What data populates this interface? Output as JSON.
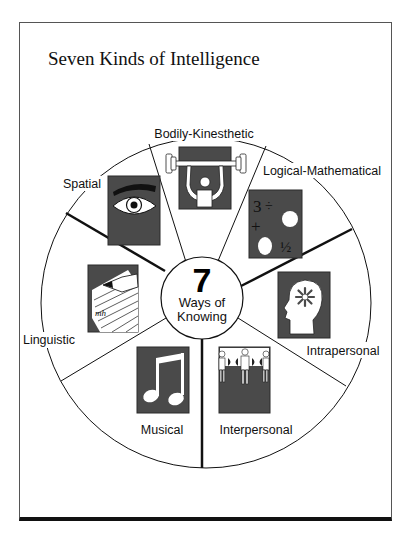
{
  "title": "Seven Kinds of Intelligence",
  "center": {
    "number": "7",
    "line1": "Ways of",
    "line2": "Knowing"
  },
  "segments": [
    {
      "label": "Bodily-Kinesthetic",
      "icon": "weightlifter-icon"
    },
    {
      "label": "Logical-Mathematical",
      "icon": "math-symbols-icon"
    },
    {
      "label": "Intrapersonal",
      "icon": "head-starburst-icon"
    },
    {
      "label": "Interpersonal",
      "icon": "people-holding-hands-icon"
    },
    {
      "label": "Musical",
      "icon": "music-note-icon"
    },
    {
      "label": "Linguistic",
      "icon": "pencil-paper-icon"
    },
    {
      "label": "Spatial",
      "icon": "eye-icon"
    }
  ],
  "math_icon": {
    "three": "3",
    "divide": "÷",
    "plus": "+",
    "half": "½"
  },
  "colors": {
    "icon_fill": "#4a4a4a",
    "icon_border": "#2a2a2a",
    "line": "#111111"
  }
}
